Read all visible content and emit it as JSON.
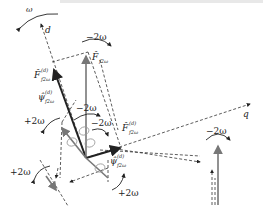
{
  "diagram": {
    "axes": {
      "d_label": "d",
      "q_label": "q"
    },
    "rotation_labels": {
      "omega": "ω",
      "minus_2omega_top": "−2ω",
      "minus_2omega_center1": "−2ω",
      "minus_2omega_center2": "−2ω",
      "plus_2omega_left": "+2ω",
      "plus_2omega_lower_left": "+2ω",
      "plus_2omega_bottom": "+2ω",
      "minus_2omega_right": "−2ω"
    },
    "vectors": {
      "F_f2w": {
        "base": "F̂",
        "sub": "f2ω",
        "sup": ""
      },
      "F_f2w_d_left": {
        "base": "F̂",
        "sub": "f2ω",
        "sup": "(d)"
      },
      "psi_f2w_d_left": {
        "base": "ψ̂",
        "sub": "f2ω",
        "sup": "(d)"
      },
      "F_f2w_d_right": {
        "base": "F̂",
        "sub": "f2ω",
        "sup": "(d)"
      },
      "psi_f2w_d_right": {
        "base": "ψ̂",
        "sub": "f2ω",
        "sup": "(d)"
      }
    },
    "colors": {
      "dark_vector": "#222222",
      "gray_vector": "#777777",
      "dashed_line": "#333333"
    }
  }
}
